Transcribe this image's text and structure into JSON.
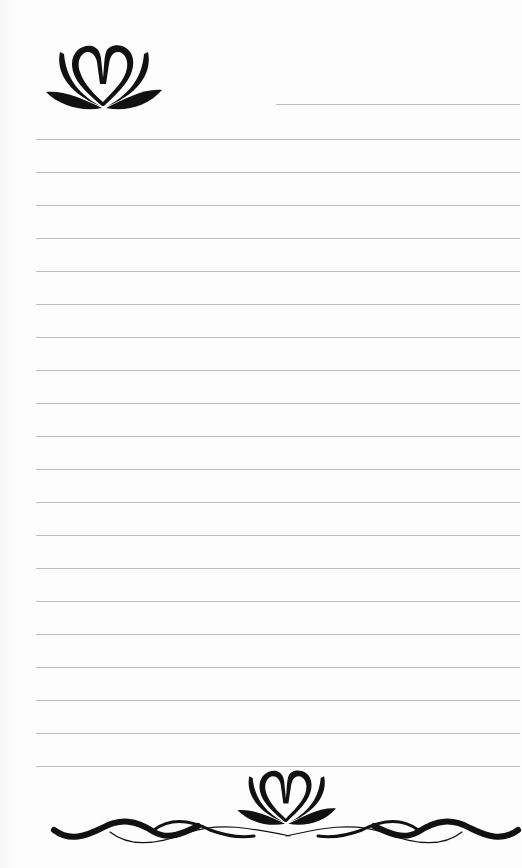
{
  "page": {
    "type": "lined stationery",
    "background_color": "#fdfdfd",
    "line_color": "#bdbdbd",
    "ink_color": "#111111"
  },
  "header": {
    "ornament": "lotus-heart-icon",
    "name_line": {
      "top": 104,
      "left": 276,
      "right": 520
    }
  },
  "lines": {
    "count": 20,
    "first_top": 139,
    "spacing": 33,
    "left": 36,
    "right": 520
  },
  "footer": {
    "ornament": "lotus-heart-wave-border-icon"
  }
}
